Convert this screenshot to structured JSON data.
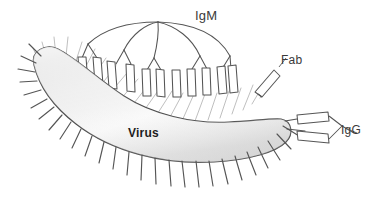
{
  "figure": {
    "background_color": "#ffffff",
    "width": 377,
    "height": 210
  },
  "labels": {
    "igm": "IgM",
    "fab": "Fab",
    "igg": "IgG",
    "virus": "Virus"
  },
  "colors": {
    "outline": "#4a4a4a",
    "antibody_stroke": "#555555",
    "spike_dark": "#555555",
    "spike_light": "#bdbdbd",
    "virus_fill_light": "#fbfbfb",
    "virus_fill_mid": "#e6e6e6",
    "virus_fill_dark": "#cfcfcf",
    "label_text": "#3a3a3a",
    "virus_label_text": "#1d1d1d",
    "page_background": "#ffffff"
  },
  "structures": {
    "virus": {
      "name": "virus",
      "shape": "crescent",
      "description": "Curved banana-shaped virion with a light gray radial gradient fill and radiating surface spikes",
      "spike_count_outer": 26,
      "spike_count_inner": 18
    },
    "igm": {
      "name": "igm-pentamer",
      "description": "Pentameric IgM: five arcs radiating from a central joining apex, each arc terminating in a Y-shaped pair of Fab arms bound to virus spikes",
      "arc_count": 5,
      "fab_arm_count": 11,
      "apex": {
        "x": 158,
        "y": 22
      }
    },
    "fab": {
      "name": "fab-fragment",
      "description": "Single free Fab fragment drawn as a tilted elongated parallelogram near the right shoulder of the virus",
      "angle_deg": 48
    },
    "igg": {
      "name": "igg-monomer",
      "description": "IgG monomer with two parallel Fab arms attached to spikes at the right tip of the virus, converging at the hinge into an Fc stem",
      "fab_arm_count": 2
    }
  },
  "leader_lines": [
    {
      "name": "fab-leader",
      "from_label": "Fab",
      "to_structure": "fab-fragment"
    },
    {
      "name": "igg-leader",
      "from_label": "IgG",
      "to_structure": "igg-monomer"
    }
  ]
}
